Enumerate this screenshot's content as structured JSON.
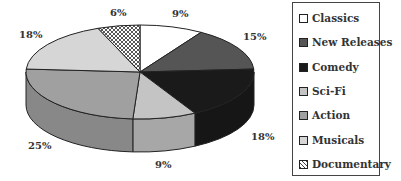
{
  "chart_data": {
    "type": "pie",
    "style": "3d",
    "title": "",
    "categories": [
      "Classics",
      "New Releases",
      "Comedy",
      "Sci-Fi",
      "Action",
      "Musicals",
      "Documentary"
    ],
    "values": [
      9,
      15,
      18,
      9,
      25,
      18,
      6
    ],
    "labels": [
      "9%",
      "15%",
      "18%",
      "9%",
      "25%",
      "18%",
      "6%"
    ],
    "colors": [
      "#ffffff",
      "#555555",
      "#1a1a1a",
      "#c4c4c4",
      "#a0a0a0",
      "#d6d6d6",
      "crosshatch"
    ],
    "legend_position": "right"
  },
  "legend": {
    "items": [
      {
        "label": "Classics"
      },
      {
        "label": "New Releases"
      },
      {
        "label": "Comedy"
      },
      {
        "label": "Sci-Fi"
      },
      {
        "label": "Action"
      },
      {
        "label": "Musicals"
      },
      {
        "label": "Documentary"
      }
    ]
  }
}
